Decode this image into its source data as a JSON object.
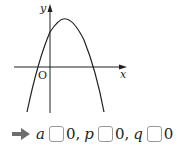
{
  "diagram": {
    "type": "parabola-graph",
    "axes": {
      "x_label": "x",
      "y_label": "y",
      "origin_label": "O"
    },
    "curve": "downward-opening parabola, vertex right of y-axis above x-axis, positive y-intercept, one negative and one positive x-intercept"
  },
  "answer": {
    "arrow_icon": "right-arrow-icon",
    "items": [
      {
        "var": "a",
        "blank": "",
        "value": "0",
        "sep": ","
      },
      {
        "var": "p",
        "blank": "",
        "value": "0",
        "sep": ","
      },
      {
        "var": "q",
        "blank": "",
        "value": "0",
        "sep": ""
      }
    ]
  },
  "colors": {
    "ink": "#231f20",
    "blank_border": "#9a9a9a",
    "arrow": "#6d6d6d"
  }
}
